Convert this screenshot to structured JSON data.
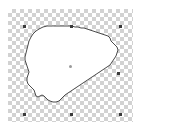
{
  "app": {
    "title": "Shape Selection Canvas",
    "canvas_width": 181,
    "canvas_height": 131
  },
  "canvas": {
    "background_type": "transparency-checkerboard",
    "checker_size_px": 4,
    "checker_light_hex": "#ffffff",
    "checker_dark_hex": "#d2d2d2",
    "region": {
      "x": 8,
      "y": 9,
      "width": 125,
      "height": 113
    }
  },
  "shape": {
    "name": "south-carolina-outline",
    "fill_hex": "#ffffff",
    "stroke_hex": "#4a4a4a",
    "stroke_width": 1,
    "path": "M 52 26 L 47 26 L 43 27 L 39 29 L 36 31 L 33 34 L 31 37 L 29 41 L 28 45 L 27 49 L 26 53 L 25 57 L 25 60 L 26 63 L 27 66 L 28 69 L 29 72 L 28 75 L 27 78 L 27 81 L 28 84 L 30 86 L 32 88 L 34 90 L 35 93 L 36 96 L 38 97 L 40 96 L 42 95 L 44 96 L 46 98 L 48 100 L 50 101 L 53 102 L 56 102 L 59 101 L 61 99 L 63 97 L 65 95 L 68 93 L 71 91 L 74 89 L 77 87 L 80 85 L 83 83 L 86 81 L 89 79 L 92 77 L 95 75 L 98 73 L 101 71 L 104 69 L 107 67 L 110 65 L 112 62 L 114 59 L 116 56 L 117 53 L 118 50 L 117 47 L 115 45 L 113 43 L 111 41 L 110 38 L 108 36 L 105 35 L 102 34 L 99 33 L 96 32 L 93 31 L 90 30 L 87 29 L 84 28 L 81 28 L 78 27 L 75 27 L 72 26 L 69 26 L 66 26 L 63 26 L 60 26 L 57 26 L 54 26 Z"
  },
  "selection": {
    "visible": true,
    "handle_color_hex": "#3a3a3a",
    "handle_size_px": 3,
    "center_anchor_color_hex": "#9a9a9a",
    "bbox": {
      "x": 24,
      "y": 26,
      "width": 96,
      "height": 88
    },
    "handles": [
      {
        "name": "handle-top-left",
        "x": 23,
        "y": 25
      },
      {
        "name": "handle-top-center",
        "x": 70,
        "y": 25
      },
      {
        "name": "handle-top-right",
        "x": 119,
        "y": 25
      },
      {
        "name": "handle-middle-right",
        "x": 117,
        "y": 72
      },
      {
        "name": "handle-bottom-right",
        "x": 119,
        "y": 113
      },
      {
        "name": "handle-bottom-center",
        "x": 70,
        "y": 113
      },
      {
        "name": "handle-bottom-left",
        "x": 23,
        "y": 113
      }
    ],
    "center_anchor": {
      "name": "center-anchor-point",
      "x": 69,
      "y": 65
    }
  }
}
